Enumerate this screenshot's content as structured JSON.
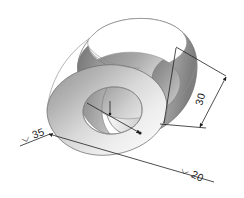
{
  "drawing": {
    "title": "Hollow Cylinder Isometric Technical Drawing",
    "object_name": "hollow-cylinder-bushing",
    "background_color": "#ffffff",
    "line_color": "#1f1f1f",
    "outline_color": "#6e6e6e",
    "shading": {
      "style": "grayscale-gradient",
      "highlight_color": "#ffffff",
      "midtone_color": "#c9c9c9",
      "shadow_color": "#8a8a8a",
      "dark_color": "#6f6f6f"
    }
  },
  "dimensions": [
    {
      "id": "outer-diameter",
      "label": "⌵30",
      "symbol": "⌵",
      "value": "35",
      "text": "⌵ 35",
      "position": "lower-left",
      "orientation": "diagonal",
      "description": "Outer diameter of cylinder"
    },
    {
      "id": "inner-diameter",
      "label": "⌵ 20",
      "symbol": "⌵",
      "value": "20",
      "text": "⌵ 20",
      "position": "lower-right",
      "orientation": "diagonal",
      "description": "Inner bore diameter"
    },
    {
      "id": "length",
      "label": "30",
      "symbol": "",
      "value": "30",
      "text": "30",
      "position": "right",
      "orientation": "rotated",
      "description": "Axial length of cylinder"
    }
  ],
  "labels": {
    "outer_diameter_text": "⌵ 35",
    "inner_diameter_text": "⌵ 20",
    "length_text": "30"
  }
}
